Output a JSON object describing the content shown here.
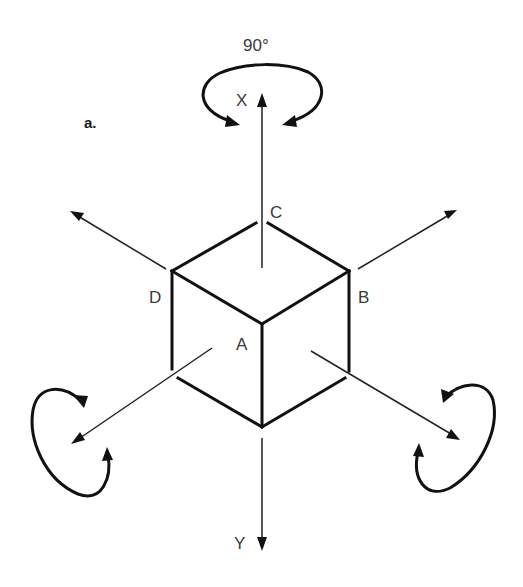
{
  "figure": {
    "panel_label": "a.",
    "rotation_label": "90°",
    "axis_labels": {
      "x": "X",
      "y": "Y"
    },
    "vertex_labels": {
      "a": "A",
      "b": "B",
      "c": "C",
      "d": "D"
    },
    "colors": {
      "ink": "#111111",
      "label": "#3a3a3a",
      "background": "#ffffff"
    }
  }
}
